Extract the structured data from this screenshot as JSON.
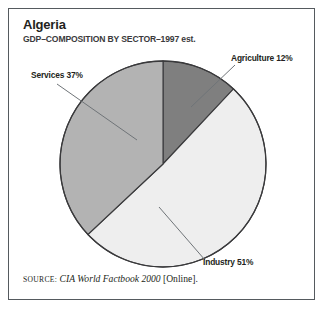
{
  "figure": {
    "title": "Algeria",
    "subtitle": "GDP–COMPOSITION BY SECTOR–1997 est."
  },
  "source": {
    "kicker": "SOURCE:",
    "work": "CIA World Factbook 2000",
    "suffix": "[Online]."
  },
  "labels": {
    "services": "Services 37%",
    "agriculture": "Agriculture 12%",
    "industry": "Industry 51%"
  },
  "colors": {
    "agriculture": "#7f7f7f",
    "industry": "#eeeeee",
    "services": "#b3b3b3",
    "outline": "#3a3a3c",
    "frame": "#555a5e",
    "text": "#231f20",
    "leader": "#6f7478"
  },
  "chart_data": {
    "type": "pie",
    "title": "Algeria",
    "subtitle": "GDP–COMPOSITION BY SECTOR–1997 est.",
    "unit": "percent",
    "start_angle_deg": 0,
    "direction": "clockwise",
    "categories": [
      "Agriculture",
      "Industry",
      "Services"
    ],
    "values": [
      12,
      51,
      37
    ],
    "labels": [
      "Agriculture 12%",
      "Industry 51%",
      "Services 37%"
    ],
    "slice_colors": [
      "#7f7f7f",
      "#eeeeee",
      "#b3b3b3"
    ],
    "legend": "none",
    "grid": false,
    "annotations": [
      "SOURCE: CIA World Factbook 2000 [Online]."
    ]
  }
}
